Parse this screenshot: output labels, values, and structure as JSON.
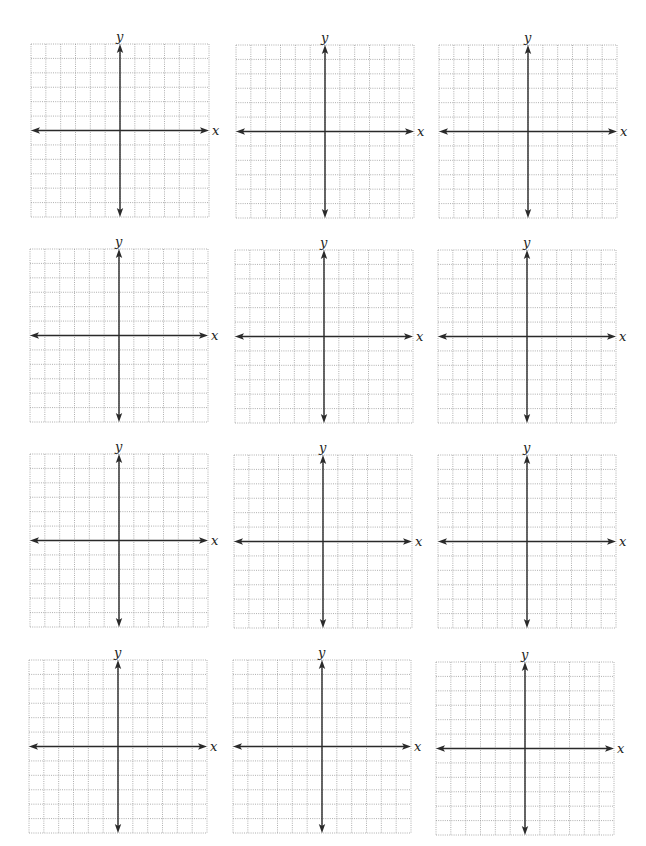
{
  "worksheet": {
    "rows": 4,
    "columns": 3,
    "grid_cells_x": 12,
    "grid_cells_y": 12,
    "axis_x_label": "x",
    "axis_y_label": "y",
    "grid_color": "#9a9a9a",
    "axis_color": "#2a2a2a",
    "background": "#ffffff"
  },
  "planes": [
    {
      "id": 1,
      "left": 27,
      "top": 32,
      "x_label": "x",
      "y_label": "y"
    },
    {
      "id": 2,
      "left": 232,
      "top": 33,
      "x_label": "x",
      "y_label": "y"
    },
    {
      "id": 3,
      "left": 435,
      "top": 33,
      "x_label": "x",
      "y_label": "y"
    },
    {
      "id": 4,
      "left": 26,
      "top": 237,
      "x_label": "x",
      "y_label": "y"
    },
    {
      "id": 5,
      "left": 231,
      "top": 238,
      "x_label": "x",
      "y_label": "y"
    },
    {
      "id": 6,
      "left": 434,
      "top": 238,
      "x_label": "x",
      "y_label": "y"
    },
    {
      "id": 7,
      "left": 26,
      "top": 442,
      "x_label": "x",
      "y_label": "y"
    },
    {
      "id": 8,
      "left": 230,
      "top": 443,
      "x_label": "x",
      "y_label": "y"
    },
    {
      "id": 9,
      "left": 434,
      "top": 443,
      "x_label": "x",
      "y_label": "y"
    },
    {
      "id": 10,
      "left": 25,
      "top": 648,
      "x_label": "x",
      "y_label": "y"
    },
    {
      "id": 11,
      "left": 229,
      "top": 648,
      "x_label": "x",
      "y_label": "y"
    },
    {
      "id": 12,
      "left": 432,
      "top": 650,
      "x_label": "x",
      "y_label": "y"
    }
  ]
}
